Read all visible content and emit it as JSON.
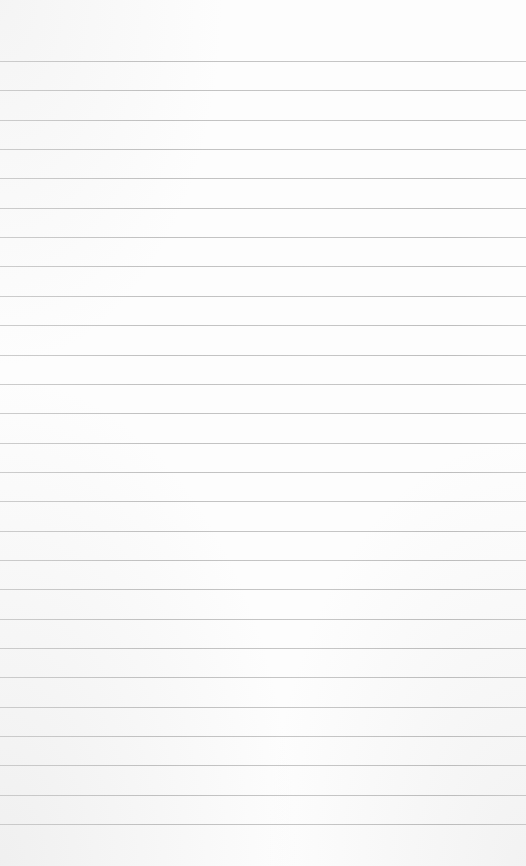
{
  "page": {
    "type": "lined-paper",
    "background_color": "#fdfdfd",
    "line_color": "#b8b8b8",
    "line_count": 27,
    "first_line_y": 61,
    "line_spacing": 29.35
  }
}
